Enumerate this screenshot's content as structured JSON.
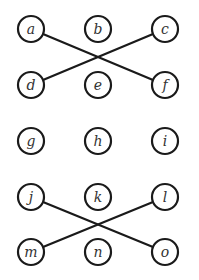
{
  "diagram": {
    "type": "graph",
    "node_radius": 13,
    "nodes": [
      {
        "id": "a",
        "label": "a",
        "x": 31,
        "y": 29
      },
      {
        "id": "b",
        "label": "b",
        "x": 98,
        "y": 29
      },
      {
        "id": "c",
        "label": "c",
        "x": 165,
        "y": 29
      },
      {
        "id": "d",
        "label": "d",
        "x": 31,
        "y": 85
      },
      {
        "id": "e",
        "label": "e",
        "x": 98,
        "y": 85
      },
      {
        "id": "f",
        "label": "f",
        "x": 165,
        "y": 85
      },
      {
        "id": "g",
        "label": "g",
        "x": 31,
        "y": 141
      },
      {
        "id": "h",
        "label": "h",
        "x": 98,
        "y": 141
      },
      {
        "id": "i",
        "label": "i",
        "x": 165,
        "y": 141
      },
      {
        "id": "j",
        "label": "j",
        "x": 31,
        "y": 197
      },
      {
        "id": "k",
        "label": "k",
        "x": 98,
        "y": 197
      },
      {
        "id": "l",
        "label": "l",
        "x": 165,
        "y": 197
      },
      {
        "id": "m",
        "label": "m",
        "x": 31,
        "y": 252
      },
      {
        "id": "n",
        "label": "n",
        "x": 98,
        "y": 252
      },
      {
        "id": "o",
        "label": "o",
        "x": 165,
        "y": 252
      }
    ],
    "edges": [
      {
        "from": "a",
        "to": "f"
      },
      {
        "from": "c",
        "to": "d"
      },
      {
        "from": "j",
        "to": "o"
      },
      {
        "from": "l",
        "to": "m"
      }
    ],
    "colors": {
      "stroke": "#1a1a1a",
      "label": "#333333",
      "fill": "#ffffff"
    }
  }
}
